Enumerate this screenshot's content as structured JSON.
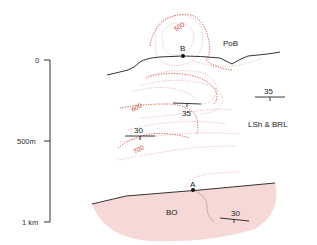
{
  "scale_bar": {
    "ticks": [
      {
        "label": "0",
        "y": 60
      },
      {
        "label": "500m",
        "y": 141
      },
      {
        "label": "1 km",
        "y": 222
      }
    ]
  },
  "units": {
    "top": "PoB",
    "middle": "LSh & BRL",
    "bottom": "BO"
  },
  "points": {
    "b": "B",
    "a": "A"
  },
  "contour_labels": {
    "c500": "500",
    "c600": "600",
    "c700": "700"
  },
  "dips": {
    "d1": "35",
    "d2": "35",
    "d3": "30",
    "d4": "30"
  },
  "colors": {
    "contour_major": "#d0352c",
    "contour_minor": "#e6b8b5",
    "bo_fill": "#f6d9d6",
    "boundary": "#333333"
  }
}
